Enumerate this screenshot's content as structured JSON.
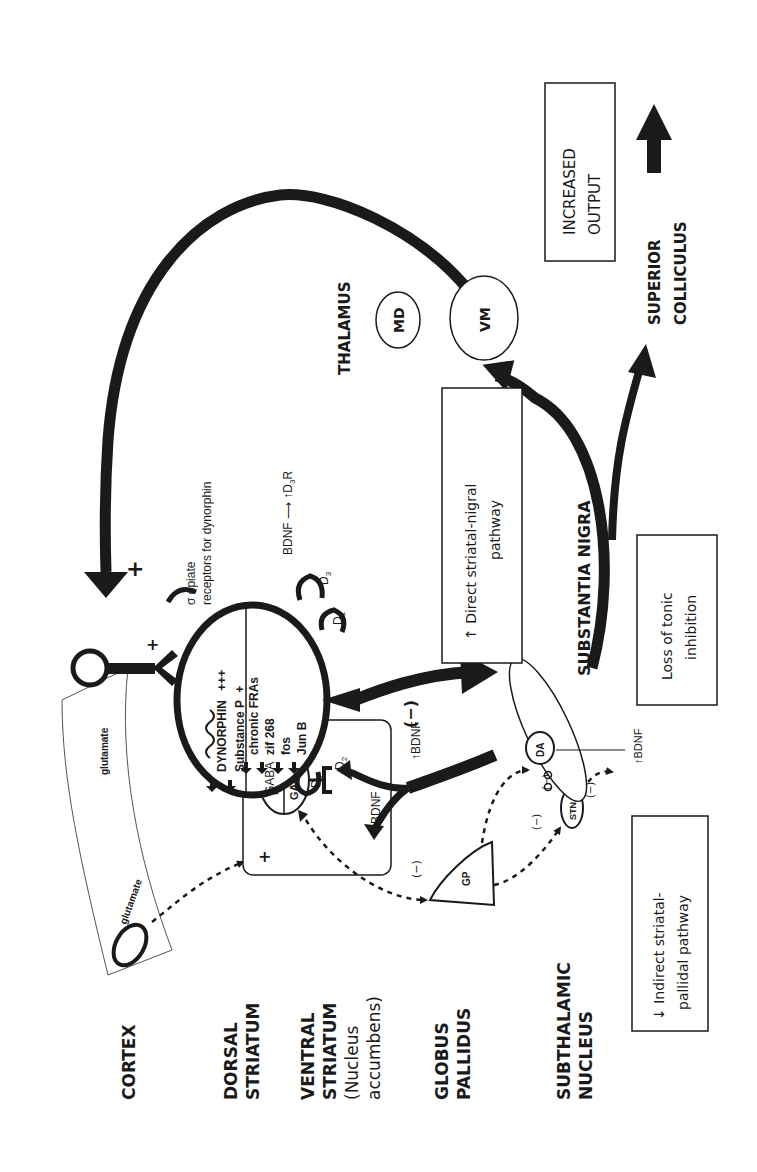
{
  "figure": {
    "orientation": "rotated 90 degrees counter-clockwise",
    "colors": {
      "ink": "#1a1a1a",
      "thin_line": "#555555",
      "background": "#ffffff"
    }
  },
  "region_labels": {
    "cortex": "CORTEX",
    "dorsal_striatum": [
      "DORSAL",
      "STRIATUM"
    ],
    "ventral_striatum": [
      "VENTRAL",
      "STRIATUM",
      "(Nucleus",
      "accumbens)"
    ],
    "globus_pallidus": [
      "GLOBUS",
      "PALLIDUS"
    ],
    "subthalamic_nucleus": [
      "SUBTHALAMIC",
      "NUCLEUS"
    ],
    "substantia_nigra": "SUBSTANTIA NIGRA",
    "thalamus": "THALAMUS",
    "superior_colliculus": [
      "SUPERIOR",
      "COLLICULUS"
    ]
  },
  "cortex": {
    "glutamate_1": "glutamate",
    "glutamate_2": "glutamate",
    "plus_terminal": "+",
    "plus_feedback": "+"
  },
  "striatal_neuron": {
    "top_half": {
      "dynorphin": "DYNORPHIN",
      "dynorphin_level": "+++",
      "substance_p": "Substance P",
      "substance_p_level": "+"
    },
    "bottom_half": {
      "gaba": "GABA",
      "items": [
        "chronic FRAs",
        "zif 268",
        "fos",
        "Jun B"
      ]
    },
    "receptors": {
      "sigma_label_1": "σ opiate",
      "sigma_label_2": "receptors for dynorphin",
      "d3": "D",
      "d3_sub": "3",
      "d1_upper": "D",
      "d1_upper_sub": "1",
      "d1_lower": "D",
      "d1_lower_sub": "1",
      "bdnf_d3r_1": "BDNF ⟶ ↑D",
      "bdnf_d3r_sub": "3",
      "bdnf_d3r_2": "R"
    }
  },
  "striatum_box": {
    "plus": "+",
    "enk": "Enk",
    "gaba": "GABA",
    "d2": "D",
    "d2_sub": "2",
    "bdnf_left": "↑BDNF",
    "bdnf_right": "↑BDNF"
  },
  "globus_pallidus": {
    "label": "GP",
    "inhibit": "(−)"
  },
  "stn": {
    "label": "STN",
    "inhibit_1": "(−)",
    "inhibit_2": "(−)",
    "inhibit_3": "(−)"
  },
  "substantia_nigra": {
    "da": "DA",
    "bdnf": "↑BDNF",
    "direct_inhibit": "(−)"
  },
  "thalamus": {
    "md": "MD",
    "vm": "VM"
  },
  "boxes": {
    "direct": [
      "↑ Direct striatal-nigral",
      "pathway"
    ],
    "indirect": [
      "↓ Indirect striatal-",
      "pallidal pathway"
    ],
    "tonic": [
      "Loss of tonic",
      "inhibition"
    ],
    "output": [
      "INCREASED",
      "OUTPUT"
    ]
  }
}
